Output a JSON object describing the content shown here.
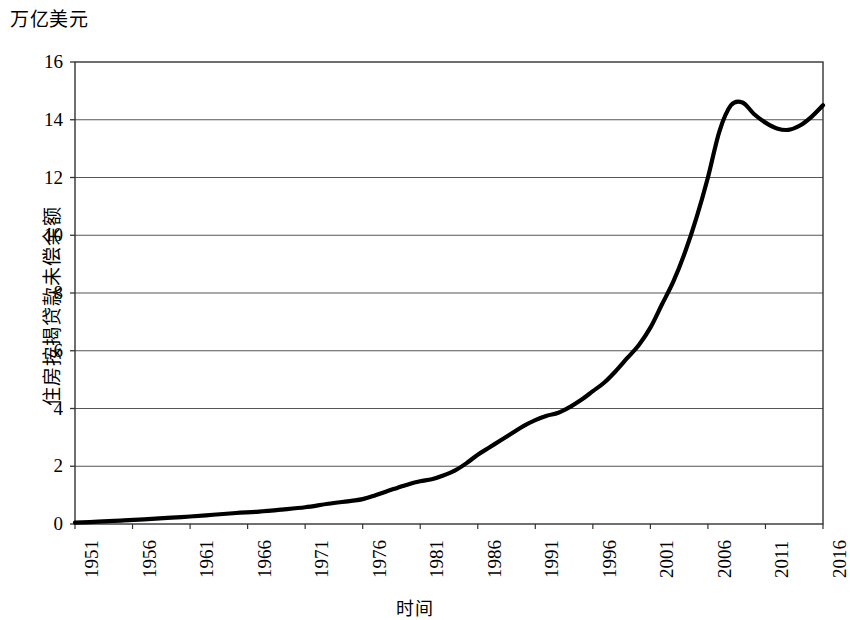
{
  "chart_data": {
    "type": "line",
    "title": "",
    "unit_label": "万亿美元",
    "xlabel": "时间",
    "ylabel": "住房按揭贷款未偿余额",
    "xlim": [
      1951,
      2016
    ],
    "ylim": [
      0,
      16
    ],
    "grid": true,
    "legend": "none",
    "y_ticks": [
      0,
      2,
      4,
      6,
      8,
      10,
      12,
      14,
      16
    ],
    "x_ticks": [
      1951,
      1956,
      1961,
      1966,
      1971,
      1976,
      1981,
      1986,
      1991,
      1996,
      2001,
      2006,
      2011,
      2016
    ],
    "series": [
      {
        "name": "住房按揭贷款未偿余额",
        "color": "#000000",
        "x": [
          1951,
          1953,
          1955,
          1957,
          1959,
          1961,
          1963,
          1965,
          1967,
          1969,
          1971,
          1973,
          1975,
          1976,
          1977,
          1978,
          1979,
          1980,
          1981,
          1982,
          1983,
          1984,
          1985,
          1986,
          1987,
          1988,
          1989,
          1990,
          1991,
          1992,
          1993,
          1994,
          1995,
          1996,
          1997,
          1998,
          1999,
          2000,
          2001,
          2002,
          2003,
          2004,
          2005,
          2006,
          2007,
          2008,
          2009,
          2010,
          2011,
          2012,
          2013,
          2014,
          2015,
          2016
        ],
        "y": [
          0.05,
          0.08,
          0.12,
          0.16,
          0.21,
          0.26,
          0.32,
          0.38,
          0.43,
          0.5,
          0.58,
          0.7,
          0.8,
          0.86,
          0.98,
          1.12,
          1.25,
          1.38,
          1.48,
          1.55,
          1.68,
          1.85,
          2.1,
          2.4,
          2.65,
          2.9,
          3.15,
          3.4,
          3.6,
          3.75,
          3.85,
          4.05,
          4.3,
          4.6,
          4.9,
          5.3,
          5.75,
          6.2,
          6.8,
          7.6,
          8.4,
          9.4,
          10.6,
          12.0,
          13.6,
          14.5,
          14.6,
          14.2,
          13.9,
          13.7,
          13.65,
          13.8,
          14.1,
          14.5
        ]
      }
    ]
  },
  "axis": {
    "y_tick_labels": [
      "0",
      "2",
      "4",
      "6",
      "8",
      "10",
      "12",
      "14",
      "16"
    ],
    "x_tick_labels": [
      "1951",
      "1956",
      "1961",
      "1966",
      "1971",
      "1976",
      "1981",
      "1986",
      "1991",
      "1996",
      "2001",
      "2006",
      "2011",
      "2016"
    ]
  }
}
